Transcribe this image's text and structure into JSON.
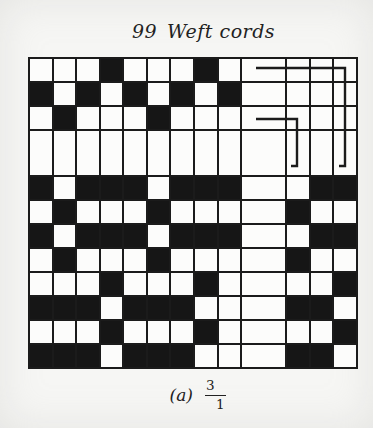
{
  "title": {
    "number": "99",
    "text": "Weft cords"
  },
  "caption": {
    "label": "(a)",
    "numerator": "3",
    "denominator": "1"
  },
  "colors": {
    "paper": "#f6f6f4",
    "ink": "#1b1b1b",
    "cell_white": "#fcfcfb",
    "cell_black": "#161616"
  },
  "grid": {
    "columns": 13,
    "rows": 12,
    "column_units": [
      1,
      1,
      1,
      1,
      1,
      1,
      1,
      1,
      1,
      2,
      1,
      1,
      1
    ],
    "row_units": [
      1,
      1,
      1,
      2,
      1,
      1,
      1,
      1,
      1,
      1,
      1,
      1
    ],
    "legend": "1 = black (weft riser), 0 = white",
    "pattern": [
      [
        0,
        0,
        0,
        1,
        0,
        0,
        0,
        1,
        0,
        0,
        0,
        0,
        0
      ],
      [
        1,
        0,
        1,
        0,
        1,
        0,
        1,
        0,
        1,
        0,
        0,
        0,
        0
      ],
      [
        0,
        1,
        0,
        0,
        0,
        1,
        0,
        0,
        0,
        0,
        0,
        0,
        0
      ],
      [
        0,
        0,
        0,
        0,
        0,
        0,
        0,
        0,
        0,
        0,
        0,
        0,
        0
      ],
      [
        1,
        0,
        1,
        1,
        1,
        0,
        1,
        1,
        1,
        0,
        0,
        1,
        1
      ],
      [
        0,
        1,
        0,
        0,
        0,
        1,
        0,
        0,
        0,
        0,
        1,
        0,
        0
      ],
      [
        1,
        0,
        1,
        1,
        1,
        0,
        1,
        1,
        1,
        0,
        0,
        1,
        1
      ],
      [
        0,
        1,
        0,
        0,
        0,
        1,
        0,
        0,
        0,
        0,
        1,
        0,
        0
      ],
      [
        0,
        0,
        0,
        1,
        0,
        0,
        0,
        1,
        0,
        0,
        0,
        0,
        1
      ],
      [
        1,
        1,
        1,
        0,
        1,
        1,
        1,
        0,
        0,
        0,
        1,
        1,
        0
      ],
      [
        0,
        0,
        0,
        1,
        0,
        0,
        0,
        1,
        0,
        0,
        0,
        0,
        1
      ],
      [
        1,
        1,
        1,
        0,
        1,
        1,
        1,
        0,
        0,
        0,
        1,
        1,
        0
      ]
    ],
    "repeat_marks": [
      {
        "name": "repeat-mark-upper",
        "points": "228,11 317,11 317,109 311,109"
      },
      {
        "name": "repeat-mark-lower",
        "points": "228,62 269,62 269,109 263,109"
      }
    ]
  }
}
